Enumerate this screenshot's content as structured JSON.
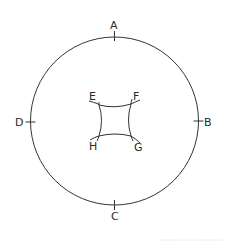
{
  "diagram": {
    "circle": {
      "cx": 114.5,
      "cy": 121,
      "r": 84,
      "color": "#333333"
    },
    "outer_points": [
      {
        "label": "A",
        "position": "top"
      },
      {
        "label": "B",
        "position": "right"
      },
      {
        "label": "C",
        "position": "bottom"
      },
      {
        "label": "D",
        "position": "left"
      }
    ],
    "inner_shape": {
      "type": "concave quadrilateral",
      "corners": [
        {
          "label": "E",
          "position": "top-left"
        },
        {
          "label": "F",
          "position": "top-right"
        },
        {
          "label": "G",
          "position": "bottom-right"
        },
        {
          "label": "H",
          "position": "bottom-left"
        }
      ]
    },
    "labels": {
      "A": "A",
      "B": "B",
      "C": "C",
      "D": "D",
      "E": "E",
      "F": "F",
      "G": "G",
      "H": "H"
    }
  }
}
